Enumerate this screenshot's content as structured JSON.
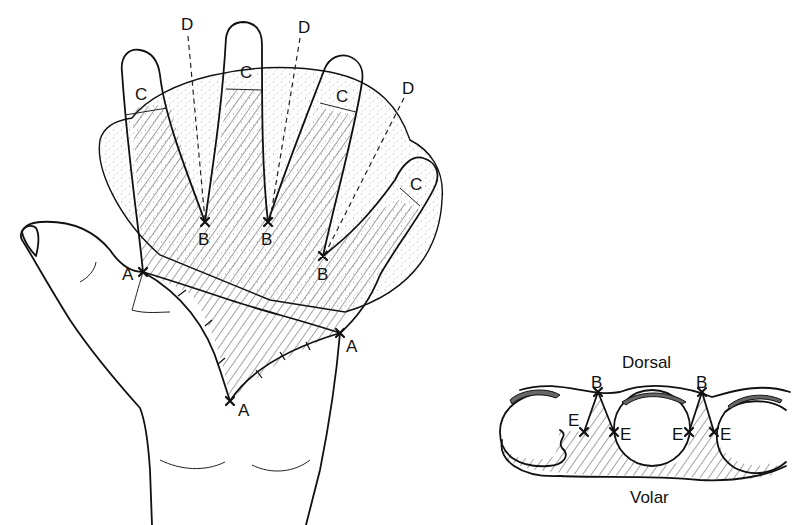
{
  "figure": {
    "hand_view": {
      "labels": {
        "A": "A",
        "B": "B",
        "C": "C",
        "D": "D"
      },
      "points": {
        "A": [
          [
            143,
            272
          ],
          [
            340,
            333
          ],
          [
            230,
            401
          ]
        ],
        "B": [
          [
            205,
            222
          ],
          [
            268,
            222
          ],
          [
            323,
            256
          ]
        ],
        "C": [
          [
            143,
            95
          ],
          [
            246,
            73
          ],
          [
            345,
            97
          ],
          [
            418,
            185
          ]
        ],
        "D": [
          [
            187,
            26
          ],
          [
            304,
            29
          ],
          [
            408,
            88
          ]
        ]
      },
      "regions": {
        "hatched": "volar skin flaps (hatched)",
        "stippled": "dorsal flap / skin graft area (stippled)"
      }
    },
    "cross_section": {
      "top_label": "Dorsal",
      "bottom_label": "Volar",
      "labels": {
        "B": "B",
        "E": "E"
      },
      "points": {
        "B": [
          [
            598,
            388
          ],
          [
            702,
            388
          ]
        ],
        "E": [
          [
            584,
            432
          ],
          [
            614,
            432
          ],
          [
            689,
            432
          ],
          [
            714,
            432
          ]
        ]
      }
    },
    "colors": {
      "ink": "#111111",
      "background": "#ffffff",
      "stipple": "#8a8a8a"
    }
  }
}
